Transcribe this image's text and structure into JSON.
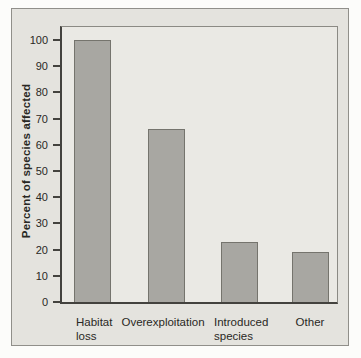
{
  "chart_data": {
    "type": "bar",
    "categories": [
      "Habitat loss",
      "Overexploitation",
      "Introduced species",
      "Other"
    ],
    "values": [
      100,
      66,
      23,
      19
    ],
    "title": "",
    "xlabel": "",
    "ylabel": "Percent of species affected",
    "ylim": [
      0,
      105
    ],
    "yticks": [
      0,
      10,
      20,
      30,
      40,
      50,
      60,
      70,
      80,
      90,
      100
    ],
    "grid": false,
    "legend": false,
    "bar_color": "#a8a7a2",
    "bar_border_color": "#75746d"
  },
  "colors": {
    "page_bg": "#fcfcfa",
    "figure_bg": "#e4e3de",
    "plot_bg": "#eae9e4",
    "axis_color": "#43423e",
    "text_color": "#292824"
  }
}
